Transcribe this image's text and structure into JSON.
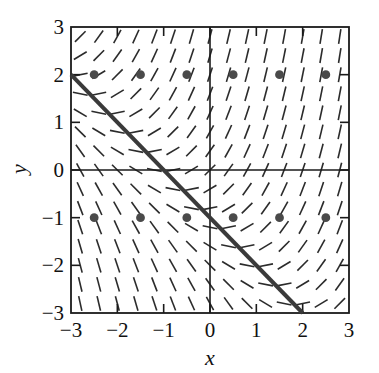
{
  "figure": {
    "type": "direction-field-plot",
    "background_color": "#ffffff",
    "ink_color": "#1a1a1a"
  },
  "axes": {
    "x_label": "x",
    "y_label": "y",
    "x_ticks": [
      "-3",
      "-2",
      "-1",
      "0",
      "1",
      "2",
      "3"
    ],
    "y_ticks": [
      "3",
      "2",
      "1",
      "0",
      "-1",
      "-2",
      "-3"
    ]
  },
  "chart_data": {
    "type": "scatter",
    "title": "",
    "xlabel": "x",
    "ylabel": "y",
    "xlim": [
      -3,
      3
    ],
    "ylim": [
      -3,
      3
    ],
    "xticks": [
      -3,
      -2,
      -1,
      0,
      1,
      2,
      3
    ],
    "yticks": [
      -3,
      -2,
      -1,
      0,
      1,
      2,
      3
    ],
    "grid": false,
    "legend": "none",
    "slope_field": {
      "kind": "direction-field",
      "x_samples": [
        -2.8,
        -2.4,
        -2.0,
        -1.6,
        -1.2,
        -0.8,
        -0.4,
        0.0,
        0.4,
        0.8,
        1.2,
        1.6,
        2.0,
        2.4,
        2.8
      ],
      "y_samples": [
        2.8,
        2.4,
        2.0,
        1.6,
        1.2,
        0.8,
        0.4,
        0.0,
        -0.4,
        -0.8,
        -1.2,
        -1.6,
        -2.0,
        -2.4,
        -2.8
      ],
      "slope_formula": "dy/dx = (x + y + 1)",
      "segment_length": 15,
      "stroke_width": 1.6,
      "stroke_color": "#2b2b2b"
    },
    "markers": {
      "name": "equilibrium-points",
      "shape": "filled-circle",
      "radius": 4.4,
      "color": "#4a4a4a",
      "points": [
        {
          "x": -2.5,
          "y": 2
        },
        {
          "x": -1.5,
          "y": 2
        },
        {
          "x": -0.5,
          "y": 2
        },
        {
          "x": 0.5,
          "y": 2
        },
        {
          "x": 1.5,
          "y": 2
        },
        {
          "x": 2.5,
          "y": 2
        },
        {
          "x": -2.5,
          "y": -1
        },
        {
          "x": -1.5,
          "y": -1
        },
        {
          "x": -0.5,
          "y": -1
        },
        {
          "x": 0.5,
          "y": -1
        },
        {
          "x": 1.5,
          "y": -1
        },
        {
          "x": 2.5,
          "y": -1
        }
      ]
    },
    "solution_line": {
      "name": "straight-line-solution",
      "equation": "y = -x - 1",
      "slope": -1,
      "intercept": -1,
      "from": {
        "x": -3,
        "y": 2
      },
      "to": {
        "x": 2,
        "y": -3
      },
      "stroke_width": 4,
      "color": "#3a3a3a"
    }
  }
}
